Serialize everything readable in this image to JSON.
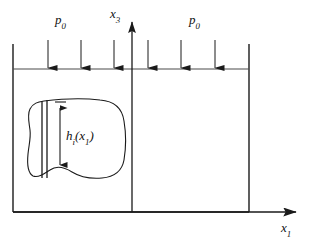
{
  "figure": {
    "background_color": "#ffffff",
    "line_color": "#1a1a1a",
    "width": 309,
    "height": 244,
    "labels": {
      "pressure_left": {
        "base": "p",
        "sub": "0"
      },
      "pressure_right": {
        "base": "p",
        "sub": "0"
      },
      "axis_vertical": {
        "base": "x",
        "sub": "3"
      },
      "axis_horizontal": {
        "base": "x",
        "sub": "1"
      },
      "height_function": {
        "base": "h",
        "sub": "i",
        "arg_open": "(x",
        "arg_sub": "1",
        "arg_close": ")"
      }
    },
    "geometry": {
      "domain_left_x": 13,
      "domain_right_x": 249,
      "domain_top_y": 69,
      "domain_bottom_y": 212,
      "vertical_axis_x": 132,
      "vertical_axis_tip_y": 16,
      "horizontal_axis_tip_x": 301,
      "pressure_arrow_count": 6,
      "pressure_arrow_xs": [
        48,
        81,
        114,
        148,
        181,
        215
      ],
      "pressure_arrow_top_y": 40,
      "pressure_arrow_tip_y": 69,
      "inclusion_strip_x1": 42,
      "inclusion_strip_x2": 47,
      "inclusion_strip_top_y": 101,
      "inclusion_strip_bottom_y": 178,
      "dimension_line_x": 60,
      "dimension_top_y": 103,
      "dimension_bottom_y": 170
    }
  }
}
